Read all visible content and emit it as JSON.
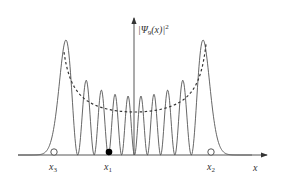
{
  "figure": {
    "y_axis_label": {
      "psi": "Ψ",
      "sub": "9",
      "arg": "(x)",
      "power": "2"
    },
    "x_axis_label": "x",
    "markers": [
      {
        "name": "x3",
        "label": "x",
        "sub": "3",
        "fill": "open"
      },
      {
        "name": "x1",
        "label": "x",
        "sub": "1",
        "fill": "filled"
      },
      {
        "name": "x2",
        "label": "x",
        "sub": "2",
        "fill": "open"
      }
    ],
    "colors": {
      "curve": "#555555",
      "axis": "#444444",
      "dashed": "#333333"
    }
  },
  "chart_data": {
    "type": "line",
    "title": "",
    "xlabel": "x",
    "ylabel": "|Ψ_9(x)|^2",
    "series": [
      {
        "name": "|Ψ_9(x)|^2",
        "style": "solid",
        "peak_count": 10,
        "peak_x_px": [
          62,
          81,
          96,
          109,
          122,
          134,
          146,
          159,
          172,
          187,
          208
        ],
        "peak_heights_rel": [
          1.0,
          0.64,
          0.55,
          0.51,
          0.5,
          0.49,
          0.5,
          0.51,
          0.55,
          0.64,
          1.0
        ]
      },
      {
        "name": "classical envelope",
        "style": "dashed",
        "min_rel": 0.37
      }
    ],
    "annotations": [
      "x3 (open circle, left)",
      "x1 (filled circle)",
      "x2 (open circle, right)"
    ]
  }
}
